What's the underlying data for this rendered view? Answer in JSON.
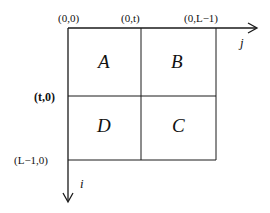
{
  "diagram": {
    "type": "matrix-block-partition",
    "stroke_color": "#1a1a1a",
    "corner_labels": {
      "top_left": "(0,0)",
      "top_mid": "(0,t)",
      "top_right": "(0,L−1)",
      "left_mid": "(t,0)",
      "left_bottom": "(L−1,0)"
    },
    "axes": {
      "horizontal": "j",
      "vertical": "i"
    },
    "quadrants": {
      "top_left": "A",
      "top_right": "B",
      "bottom_left": "D",
      "bottom_right": "C"
    }
  }
}
